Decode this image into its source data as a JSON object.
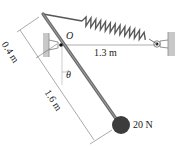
{
  "diagram": {
    "type": "mechanics-free-body",
    "elements": {
      "pivot": {
        "label": "O"
      },
      "spring_length": {
        "label": "1.3 m"
      },
      "upper_rod_segment": {
        "label": "0.4 m"
      },
      "lower_rod_segment": {
        "label": "1.6 m"
      },
      "angle": {
        "label": "θ"
      },
      "weight": {
        "label": "20 N"
      }
    },
    "colors": {
      "rod": "#6e6e6e",
      "spring": "#5a5a5a",
      "ball": "#3c3c3c",
      "wall": "#c8c8c8",
      "dimension_line": "#555555"
    }
  }
}
